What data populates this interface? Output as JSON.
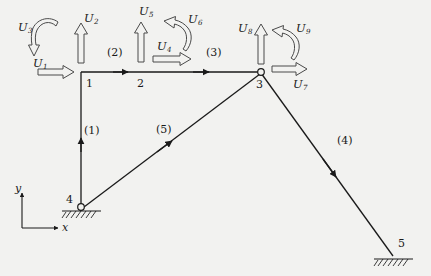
{
  "figure": {
    "background_color": "#f2f2f0",
    "line_color": "#1a1a1a",
    "hollow_arrow_color": "#555555"
  },
  "axes": {
    "x_label": "x",
    "y_label": "y",
    "origin": {
      "x": 22,
      "y": 228
    },
    "x_tip": {
      "x": 62,
      "y": 228
    },
    "y_tip": {
      "x": 22,
      "y": 190
    }
  },
  "nodes": [
    {
      "id": "1",
      "label": "1",
      "x": 80,
      "y": 72,
      "type": "rigid-corner",
      "label_x": 85,
      "label_y": 78
    },
    {
      "id": "2",
      "label": "2",
      "x": 140,
      "y": 72,
      "type": "beam-point",
      "label_x": 137,
      "label_y": 78
    },
    {
      "id": "3",
      "label": "3",
      "x": 261,
      "y": 72,
      "type": "pin-joint",
      "label_x": 256,
      "label_y": 80
    },
    {
      "id": "4",
      "label": "4",
      "x": 81,
      "y": 207,
      "type": "pin-support",
      "label_x": 66,
      "label_y": 196
    },
    {
      "id": "5",
      "label": "5",
      "x": 393,
      "y": 256,
      "type": "pin-support",
      "label_x": 398,
      "label_y": 240
    }
  ],
  "members": [
    {
      "id": "1",
      "label": "(1)",
      "from": "4",
      "to": "1",
      "label_x": 84,
      "label_y": 126,
      "direction": "up"
    },
    {
      "id": "2",
      "label": "(2)",
      "from": "1",
      "to": "2",
      "label_x": 108,
      "label_y": 49,
      "direction": "right"
    },
    {
      "id": "3",
      "label": "(3)",
      "from": "2",
      "to": "3",
      "label_x": 207,
      "label_y": 49,
      "direction": "right"
    },
    {
      "id": "4",
      "label": "(4)",
      "from": "3",
      "to": "5",
      "label_x": 339,
      "label_y": 137,
      "direction": "down-right"
    },
    {
      "id": "5",
      "label": "(5)",
      "from": "4",
      "to": "3",
      "label_x": 157,
      "label_y": 126,
      "direction": "up-right"
    }
  ],
  "degrees_of_freedom": [
    {
      "id": "U1",
      "label": "U",
      "sub": "1",
      "node": "1",
      "kind": "translation",
      "axis": "x",
      "label_x": 33,
      "label_y": 58
    },
    {
      "id": "U2",
      "label": "U",
      "sub": "2",
      "node": "1",
      "kind": "translation",
      "axis": "y",
      "label_x": 84,
      "label_y": 13
    },
    {
      "id": "U3",
      "label": "U",
      "sub": "3",
      "node": "1",
      "kind": "rotation",
      "axis": "z",
      "label_x": 18,
      "label_y": 22
    },
    {
      "id": "U4",
      "label": "U",
      "sub": "4",
      "node": "2",
      "kind": "translation",
      "axis": "x",
      "label_x": 158,
      "label_y": 43
    },
    {
      "id": "U5",
      "label": "U",
      "sub": "5",
      "node": "2",
      "kind": "translation",
      "axis": "y",
      "label_x": 139,
      "label_y": 8
    },
    {
      "id": "U6",
      "label": "U",
      "sub": "6",
      "node": "2",
      "kind": "rotation",
      "axis": "z",
      "label_x": 188,
      "label_y": 16
    },
    {
      "id": "U7",
      "label": "U",
      "sub": "7",
      "node": "3",
      "kind": "translation",
      "axis": "x",
      "label_x": 293,
      "label_y": 80
    },
    {
      "id": "U8",
      "label": "U",
      "sub": "8",
      "node": "3",
      "kind": "translation",
      "axis": "y",
      "label_x": 240,
      "label_y": 24
    },
    {
      "id": "U9",
      "label": "U",
      "sub": "9",
      "node": "3",
      "kind": "rotation",
      "axis": "z",
      "label_x": 296,
      "label_y": 25
    }
  ]
}
